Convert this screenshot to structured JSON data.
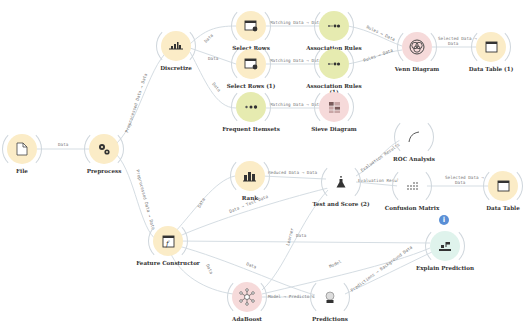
{
  "workflow": {
    "nodes": [
      {
        "id": "file",
        "label": "File",
        "icon": "file-icon",
        "color": "yellow"
      },
      {
        "id": "preprocess",
        "label": "Preprocess",
        "icon": "gears-icon",
        "color": "yellow"
      },
      {
        "id": "discretize",
        "label": "Discretize",
        "icon": "discretize-icon",
        "color": "yellow"
      },
      {
        "id": "select_rows",
        "label": "Select Rows",
        "icon": "select-rows-icon",
        "color": "yellow"
      },
      {
        "id": "select_rows_1",
        "label": "Select Rows (1)",
        "icon": "select-rows-icon",
        "color": "yellow"
      },
      {
        "id": "frequent_itemsets",
        "label": "Frequent Itemsets",
        "icon": "itemsets-icon",
        "color": "green"
      },
      {
        "id": "association_rules",
        "label": "Association Rules",
        "icon": "rules-icon",
        "color": "green"
      },
      {
        "id": "association_rules_1",
        "label": "Association Rules (1)",
        "icon": "rules-icon",
        "color": "green"
      },
      {
        "id": "sieve_diagram",
        "label": "Sieve Diagram",
        "icon": "sieve-icon",
        "color": "red"
      },
      {
        "id": "venn_diagram",
        "label": "Venn Diagram",
        "icon": "venn-icon",
        "color": "red"
      },
      {
        "id": "data_table_1",
        "label": "Data Table (1)",
        "icon": "table-icon",
        "color": "yellow"
      },
      {
        "id": "rank",
        "label": "Rank",
        "icon": "rank-icon",
        "color": "yellow"
      },
      {
        "id": "test_and_score",
        "label": "Test and Score (2)",
        "icon": "flask-icon",
        "color": "white"
      },
      {
        "id": "roc_analysis",
        "label": "ROC Analysis",
        "icon": "roc-curve-icon",
        "color": "white"
      },
      {
        "id": "confusion_matrix",
        "label": "Confusion Matrix",
        "icon": "matrix-icon",
        "color": "white"
      },
      {
        "id": "data_table",
        "label": "Data Table",
        "icon": "table-icon",
        "color": "yellow"
      },
      {
        "id": "feature_constructor",
        "label": "Feature Constructor",
        "icon": "function-icon",
        "color": "yellow"
      },
      {
        "id": "adaboost",
        "label": "AdaBoost",
        "icon": "network-icon",
        "color": "red"
      },
      {
        "id": "predictions",
        "label": "Predictions",
        "icon": "crystal-ball-icon",
        "color": "white"
      },
      {
        "id": "explain_prediction",
        "label": "Explain Prediction",
        "icon": "explain-icon",
        "color": "mint",
        "badge": "i"
      }
    ],
    "links": [
      {
        "label": "Data"
      },
      {
        "label": "Preprocessed Data → Data"
      },
      {
        "label": "Data"
      },
      {
        "label": "Data"
      },
      {
        "label": "Data"
      },
      {
        "label": "Matching Data → Data"
      },
      {
        "label": "Matching Data → Data"
      },
      {
        "label": "Matching Data → Data"
      },
      {
        "label": "Rules → Data"
      },
      {
        "label": "Rules → Data"
      },
      {
        "label": "Selected Data →"
      },
      {
        "label": "Data"
      },
      {
        "label": "Preprocessed Data → Data"
      },
      {
        "label": "Data"
      },
      {
        "label": "Data → Test Data"
      },
      {
        "label": "Reduced Data → Data"
      },
      {
        "label": "Evaluation Results"
      },
      {
        "label": "Evaluation Results"
      },
      {
        "label": "Selected Data →"
      },
      {
        "label": "Data"
      },
      {
        "label": "Data"
      },
      {
        "label": "Data"
      },
      {
        "label": "Learner"
      },
      {
        "label": "Model"
      },
      {
        "label": "Model → Predictors"
      },
      {
        "label": "Predictions → Background Data"
      }
    ]
  }
}
